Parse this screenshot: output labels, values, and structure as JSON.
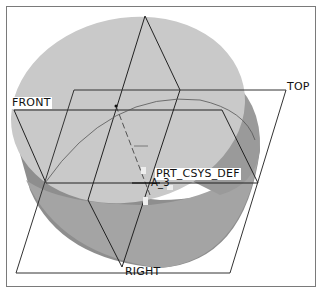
{
  "viewport": {
    "datum_planes": [
      {
        "id": "front",
        "label": "FRONT"
      },
      {
        "id": "top",
        "label": "TOP"
      },
      {
        "id": "right",
        "label": "RIGHT"
      }
    ],
    "csys": {
      "label": "PRT_CSYS_DEF"
    },
    "axis": {
      "label": "A_3"
    },
    "colors": {
      "top_face": "#c8c8c8",
      "side_dark": "#8c8c8c",
      "side_mid": "#a2a2a2",
      "edge": "#222222",
      "frame": "#7a7a7a"
    }
  }
}
